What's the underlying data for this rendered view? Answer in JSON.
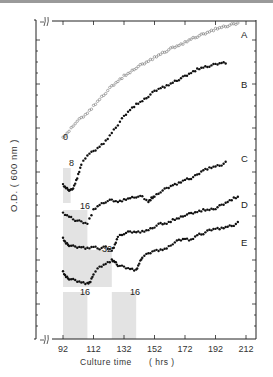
{
  "chart_data": {
    "type": "scatter",
    "title": "",
    "xlabel": "Culture time",
    "xunit": "( hrs )",
    "ylabel": "O.D. ( 600 nm )",
    "xlim": [
      90,
      212
    ],
    "x_ticks": [
      92,
      112,
      132,
      152,
      172,
      192,
      212
    ],
    "y_axis_broken": true,
    "y_scale_units": "relative (curves vertically offset)",
    "grid": false,
    "legend_position": "curve labels at right end",
    "shaded_regions": [
      {
        "series": "B",
        "label": "8",
        "x_start": 92,
        "x_end": 97
      },
      {
        "series": "C",
        "label": "16",
        "x_start": 92,
        "x_end": 108
      },
      {
        "series": "D",
        "label": "32",
        "x_start": 92,
        "x_end": 124
      },
      {
        "series": "E",
        "label": "16",
        "x_start": 92,
        "x_end": 108
      },
      {
        "series": "E",
        "label": "16",
        "x_start": 124,
        "x_end": 140
      }
    ],
    "series": [
      {
        "name": "A",
        "annotation": "0",
        "marker": "open-circle",
        "x": [
          92,
          96,
          100,
          104,
          108,
          112,
          116,
          120,
          124,
          128,
          132,
          136,
          140,
          144,
          148,
          152,
          156,
          160,
          164,
          168,
          172,
          176,
          180,
          184,
          188,
          192,
          196,
          200,
          204,
          208
        ],
        "y": [
          0.6,
          0.62,
          0.645,
          0.66,
          0.675,
          0.695,
          0.715,
          0.735,
          0.755,
          0.77,
          0.785,
          0.795,
          0.81,
          0.82,
          0.83,
          0.84,
          0.85,
          0.86,
          0.87,
          0.877,
          0.885,
          0.895,
          0.903,
          0.91,
          0.918,
          0.925,
          0.93,
          0.935,
          0.94,
          0.945
        ]
      },
      {
        "name": "B",
        "annotation": "8",
        "marker": "filled-circle",
        "x": [
          92,
          94,
          96,
          98,
          100,
          102,
          104,
          108,
          112,
          116,
          120,
          124,
          128,
          132,
          136,
          140,
          144,
          148,
          152,
          156,
          160,
          164,
          168,
          172,
          176,
          180,
          184,
          188,
          192,
          196,
          200
        ],
        "y": [
          0.46,
          0.45,
          0.445,
          0.445,
          0.465,
          0.49,
          0.52,
          0.55,
          0.56,
          0.575,
          0.59,
          0.615,
          0.64,
          0.665,
          0.685,
          0.7,
          0.71,
          0.725,
          0.74,
          0.75,
          0.755,
          0.765,
          0.775,
          0.785,
          0.795,
          0.805,
          0.81,
          0.815,
          0.82,
          0.825,
          0.825
        ]
      },
      {
        "name": "C",
        "annotation": "16",
        "marker": "filled-circle",
        "x": [
          92,
          96,
          100,
          104,
          108,
          112,
          116,
          120,
          124,
          128,
          132,
          136,
          140,
          144,
          148,
          150,
          152,
          156,
          160,
          164,
          168,
          172,
          176,
          180,
          184,
          188,
          192,
          196,
          200
        ],
        "y": [
          0.375,
          0.365,
          0.355,
          0.35,
          0.345,
          0.385,
          0.4,
          0.41,
          0.415,
          0.41,
          0.415,
          0.42,
          0.425,
          0.425,
          0.41,
          0.42,
          0.425,
          0.44,
          0.45,
          0.46,
          0.465,
          0.475,
          0.48,
          0.49,
          0.505,
          0.51,
          0.515,
          0.52,
          0.53
        ]
      },
      {
        "name": "D",
        "annotation": "32",
        "marker": "filled-circle",
        "x": [
          92,
          94,
          96,
          100,
          104,
          108,
          112,
          116,
          120,
          124,
          126,
          128,
          132,
          136,
          140,
          144,
          148,
          152,
          156,
          160,
          164,
          168,
          172,
          176,
          180,
          184,
          188,
          192,
          196,
          200,
          204,
          208
        ],
        "y": [
          0.3,
          0.285,
          0.28,
          0.275,
          0.275,
          0.27,
          0.275,
          0.27,
          0.275,
          0.265,
          0.28,
          0.305,
          0.315,
          0.32,
          0.32,
          0.32,
          0.325,
          0.335,
          0.345,
          0.345,
          0.355,
          0.36,
          0.37,
          0.375,
          0.38,
          0.385,
          0.385,
          0.39,
          0.4,
          0.41,
          0.42,
          0.425
        ]
      },
      {
        "name": "E",
        "annotation": "16 / 16",
        "marker": "filled-circle",
        "x": [
          92,
          94,
          96,
          100,
          104,
          108,
          110,
          112,
          116,
          120,
          124,
          126,
          128,
          132,
          136,
          140,
          142,
          144,
          148,
          152,
          156,
          160,
          164,
          168,
          172,
          176,
          180,
          184,
          188,
          192,
          196,
          200,
          204,
          208
        ],
        "y": [
          0.2,
          0.185,
          0.18,
          0.175,
          0.17,
          0.165,
          0.17,
          0.195,
          0.215,
          0.225,
          0.235,
          0.23,
          0.22,
          0.215,
          0.21,
          0.205,
          0.225,
          0.245,
          0.255,
          0.265,
          0.265,
          0.27,
          0.285,
          0.295,
          0.3,
          0.295,
          0.31,
          0.315,
          0.325,
          0.33,
          0.33,
          0.335,
          0.34,
          0.35
        ]
      }
    ]
  },
  "labels": {
    "series_A": "A",
    "series_B": "B",
    "series_C": "C",
    "series_D": "D",
    "series_E": "E",
    "ann_A": "0",
    "ann_B": "8",
    "ann_C": "16",
    "ann_D": "32",
    "ann_E1": "16",
    "ann_E2": "16",
    "ylabel": "O.D. ( 600 nm )",
    "xlabel": "Culture time      ( hrs )",
    "xticks": [
      "92",
      "112",
      "132",
      "152",
      "172",
      "192",
      "212"
    ]
  }
}
